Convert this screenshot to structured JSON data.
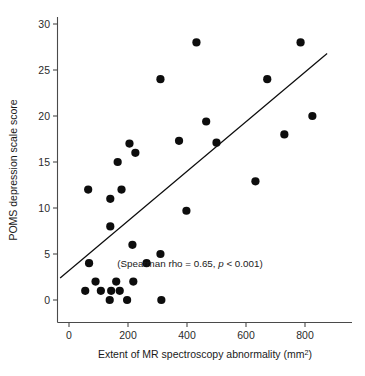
{
  "chart_data": {
    "type": "scatter",
    "title": "",
    "xlabel": "Extent of MR spectroscopy abnormality (mm2)",
    "xlabel_main": "Extent of MR spectroscopy abnormality (mm",
    "xlabel_sup": "2",
    "xlabel_tail": ")",
    "ylabel": "POMS depression scale score",
    "xlim": [
      -35,
      900
    ],
    "ylim": [
      -1.2,
      31.5
    ],
    "xticks": [
      0,
      200,
      400,
      600,
      800
    ],
    "xtick_labels": [
      "0",
      "200",
      "400",
      "600",
      "800"
    ],
    "yticks": [
      0,
      5,
      10,
      15,
      20,
      25,
      30
    ],
    "ytick_labels": [
      "0",
      "5",
      "10",
      "15",
      "20",
      "25",
      "30"
    ],
    "grid": false,
    "legend": "none",
    "marker": "filled-circle",
    "marker_color": "#0d0d0d",
    "marker_size_px": 4.1,
    "points": [
      {
        "x": 65,
        "y": 12.0
      },
      {
        "x": 68,
        "y": 4.0
      },
      {
        "x": 55,
        "y": 1.0
      },
      {
        "x": 90,
        "y": 2.0
      },
      {
        "x": 108,
        "y": 1.0
      },
      {
        "x": 140,
        "y": 11.0
      },
      {
        "x": 140,
        "y": 8.0
      },
      {
        "x": 138,
        "y": 0.0
      },
      {
        "x": 143,
        "y": 1.0
      },
      {
        "x": 160,
        "y": 2.0
      },
      {
        "x": 165,
        "y": 15.0
      },
      {
        "x": 172,
        "y": 1.0
      },
      {
        "x": 178,
        "y": 12.0
      },
      {
        "x": 197,
        "y": 0.0
      },
      {
        "x": 205,
        "y": 17.0
      },
      {
        "x": 215,
        "y": 6.0
      },
      {
        "x": 218,
        "y": 2.0
      },
      {
        "x": 225,
        "y": 16.0
      },
      {
        "x": 263,
        "y": 4.0
      },
      {
        "x": 310,
        "y": 5.0
      },
      {
        "x": 313,
        "y": 0.0
      },
      {
        "x": 310,
        "y": 24.0
      },
      {
        "x": 373,
        "y": 17.3
      },
      {
        "x": 398,
        "y": 9.7
      },
      {
        "x": 432,
        "y": 28.0
      },
      {
        "x": 465,
        "y": 19.4
      },
      {
        "x": 500,
        "y": 17.1
      },
      {
        "x": 632,
        "y": 12.9
      },
      {
        "x": 672,
        "y": 24.0
      },
      {
        "x": 730,
        "y": 18.0
      },
      {
        "x": 785,
        "y": 28.0
      },
      {
        "x": 825,
        "y": 20.0
      }
    ],
    "fit_line": {
      "label": "regression-line",
      "x1": -30,
      "y1": 2.4,
      "x2": 875,
      "y2": 26.8,
      "color": "#0d0d0d"
    },
    "annotations": [
      {
        "name": "spearman-annotation",
        "x": 410,
        "y": 3.6,
        "prefix": "(Spearman rho = 0.65, ",
        "italic": "p",
        "suffix": " < 0.001)"
      }
    ]
  }
}
